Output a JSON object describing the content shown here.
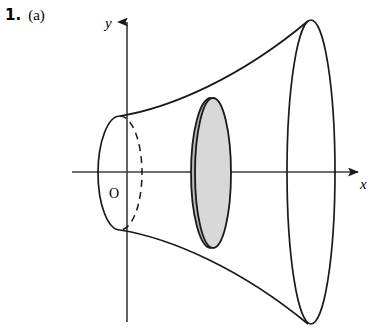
{
  "figure": {
    "problem_number": "1.",
    "problem_part": "(a)",
    "background_color": "#ffffff",
    "stroke_color": "#1a1a1a",
    "axis_color": "#3c3c3c",
    "disk_fill_color": "#d8d8d8",
    "disk_edge_color": "#c0c0c0",
    "width": 375,
    "height": 334
  },
  "axes": {
    "y_label": "y",
    "x_label": "x",
    "origin_label": "O",
    "y_axis_x": 127,
    "x_axis_y": 172,
    "y_axis_top": 14,
    "y_axis_bottom": 322,
    "x_axis_left": 72,
    "x_axis_right": 366
  },
  "solid": {
    "description": "solid-of-revolution-horn",
    "left_ellipse": {
      "cx": 120,
      "cy": 173,
      "rx": 22,
      "ry": 57,
      "front_half": "solid",
      "back_half": "dashed"
    },
    "shaded_disk": {
      "cx": 211,
      "cy": 173,
      "rx": 20,
      "ry": 75,
      "fill": "#d8d8d8",
      "label": "cross-sectional-disk"
    },
    "right_ellipse": {
      "cx": 311,
      "cy": 172,
      "rx": 24,
      "ry": 152
    },
    "top_profile": "curve from left ellipse top to right ellipse top",
    "bottom_profile": "curve from left ellipse bottom to right ellipse bottom"
  }
}
